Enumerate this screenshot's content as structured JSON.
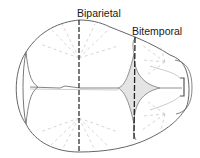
{
  "diagram": {
    "labels": {
      "biparietal": "Biparietal",
      "bitemporal": "Bitemporal"
    },
    "colors": {
      "outline": "#555555",
      "diameter_line": "#222222",
      "radiating_lines": "#bbbbbb",
      "fontanelle_fill": "#e4e4e4"
    }
  }
}
